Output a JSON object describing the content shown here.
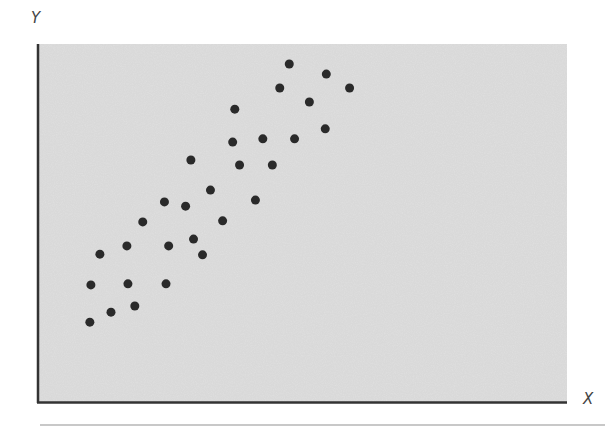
{
  "chart_data": {
    "type": "scatter",
    "title": "",
    "xlabel": "X",
    "ylabel": "Y",
    "grid": false,
    "legend": null,
    "xlim": [
      0,
      100
    ],
    "ylim": [
      0,
      100
    ],
    "x_ticks": [],
    "y_ticks": [],
    "series": [
      {
        "name": "points",
        "color": "#2a2a2a",
        "points": [
          {
            "x": 9.8,
            "y": 22.3
          },
          {
            "x": 13.8,
            "y": 25.1
          },
          {
            "x": 18.3,
            "y": 26.8
          },
          {
            "x": 10.0,
            "y": 32.7
          },
          {
            "x": 17.0,
            "y": 33.0
          },
          {
            "x": 24.2,
            "y": 33.0
          },
          {
            "x": 11.7,
            "y": 41.3
          },
          {
            "x": 16.8,
            "y": 43.6
          },
          {
            "x": 24.7,
            "y": 43.6
          },
          {
            "x": 29.4,
            "y": 45.5
          },
          {
            "x": 31.1,
            "y": 41.1
          },
          {
            "x": 19.8,
            "y": 50.3
          },
          {
            "x": 23.9,
            "y": 55.9
          },
          {
            "x": 27.9,
            "y": 54.7
          },
          {
            "x": 32.6,
            "y": 59.2
          },
          {
            "x": 34.9,
            "y": 50.6
          },
          {
            "x": 28.9,
            "y": 67.6
          },
          {
            "x": 41.1,
            "y": 56.4
          },
          {
            "x": 38.1,
            "y": 66.2
          },
          {
            "x": 44.3,
            "y": 66.2
          },
          {
            "x": 36.8,
            "y": 72.6
          },
          {
            "x": 42.5,
            "y": 73.5
          },
          {
            "x": 37.2,
            "y": 81.8
          },
          {
            "x": 48.5,
            "y": 73.5
          },
          {
            "x": 51.3,
            "y": 83.8
          },
          {
            "x": 54.3,
            "y": 76.3
          },
          {
            "x": 45.7,
            "y": 87.7
          },
          {
            "x": 47.5,
            "y": 94.4
          },
          {
            "x": 54.5,
            "y": 91.6
          },
          {
            "x": 58.9,
            "y": 87.7
          }
        ]
      }
    ],
    "style": {
      "plot_background": "#d9d9d9",
      "axis_color": "#333333",
      "marker_radius": 4.5
    }
  },
  "labels": {
    "x_axis": "X",
    "y_axis": "Y"
  }
}
